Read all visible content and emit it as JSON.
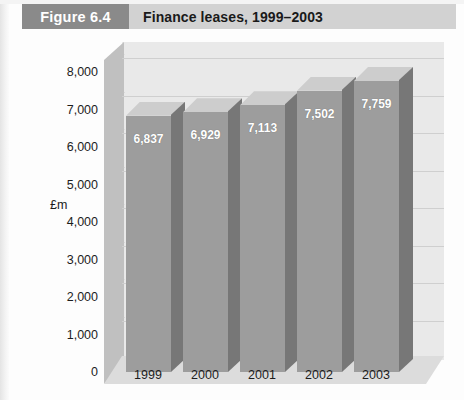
{
  "header": {
    "figure_label": "Figure 6.4",
    "title": "Finance leases, 1999–2003",
    "badge_color": "#8a8a8a",
    "bar_color": "#d2d2d2"
  },
  "chart_data": {
    "type": "bar",
    "title": "Finance leases, 1999–2003",
    "categories": [
      "1999",
      "2000",
      "2001",
      "2002",
      "2003"
    ],
    "values": [
      6837,
      6929,
      7113,
      7502,
      7759
    ],
    "value_labels": [
      "6,837",
      "6,929",
      "7,113",
      "7,502",
      "7,759"
    ],
    "xlabel": "",
    "ylabel": "£m",
    "ylim": [
      0,
      8000
    ],
    "ytick_values": [
      8000,
      7000,
      6000,
      5000,
      4000,
      3000,
      2000,
      1000,
      0
    ],
    "ytick_labels": [
      "8,000",
      "7,000",
      "6,000",
      "5,000",
      "4,000",
      "3,000",
      "2,000",
      "1,000",
      "0"
    ],
    "grid": true,
    "legend": null,
    "style": "3d-column",
    "series_color": "#9d9d9d",
    "plot_background": "#e9e9e9"
  }
}
